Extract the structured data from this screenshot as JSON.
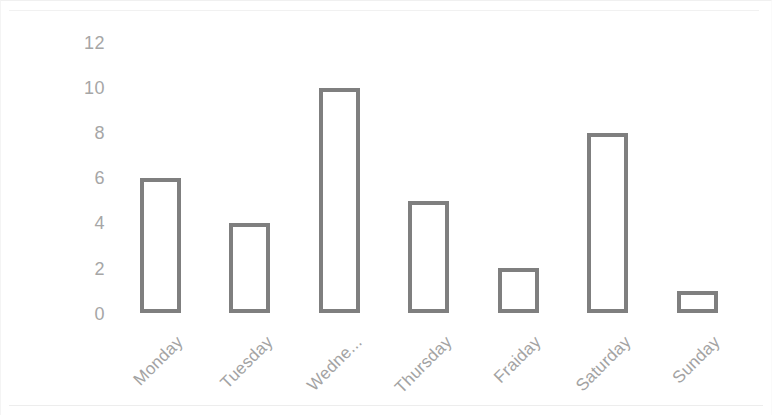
{
  "chart_data": {
    "type": "bar",
    "title": "",
    "subtitle": "",
    "xlabel": "",
    "ylabel": "",
    "categories": [
      "Monday",
      "Tuesday",
      "Wedne...",
      "Thursday",
      "Fraiday",
      "Saturday",
      "Sunday"
    ],
    "values": [
      6,
      4,
      10,
      5,
      2,
      8,
      1
    ],
    "ytick_labels": [
      "12",
      "10",
      "8",
      "6",
      "4",
      "2",
      "0"
    ],
    "ytick_values": [
      12,
      10,
      8,
      6,
      4,
      2,
      0
    ],
    "ylim": [
      0,
      12
    ],
    "grid": false,
    "legend": false,
    "legend_position": "none",
    "bar_outline_color": "#7f7f7f",
    "bar_fill_color": "#ffffff",
    "tick_label_color": "#a6a6a6",
    "category_label_color": "#a3a3a3",
    "background_color": "#ffffff",
    "xtick_rotation_degrees": -45,
    "note": "Category labels are rotated; third category text is truncated with an ellipsis and fifth category is misspelled as shown."
  }
}
